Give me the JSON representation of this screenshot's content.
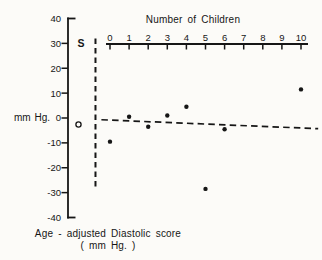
{
  "figure": {
    "bg_color": "#fcfbf8",
    "ink_color": "#161616"
  },
  "chart_data": {
    "type": "scatter",
    "title": "Number of Children",
    "top_axis": {
      "label": "Number of Children",
      "position": "top",
      "ticks": [
        0,
        1,
        2,
        3,
        4,
        5,
        6,
        7,
        8,
        9,
        10
      ],
      "range": [
        0,
        10
      ]
    },
    "y_axis": {
      "label": "mm Hg.",
      "ticks": [
        40,
        30,
        20,
        10,
        0,
        -10,
        -20,
        -30,
        -40
      ],
      "range": [
        -40,
        40
      ]
    },
    "points": [
      {
        "x": 0,
        "y": -9.5
      },
      {
        "x": 1,
        "y": 0.5
      },
      {
        "x": 2,
        "y": -3.5
      },
      {
        "x": 3,
        "y": 1
      },
      {
        "x": 4,
        "y": 4.5
      },
      {
        "x": 5,
        "y": -28.5
      },
      {
        "x": 6,
        "y": -4.5
      },
      {
        "x": 10,
        "y": 11.5
      }
    ],
    "s_label": "S",
    "open_circle_point": {
      "x": -1.65,
      "y": -2.6
    },
    "separator_line": {
      "x": -0.76,
      "y_top": 32,
      "y_bottom": -28,
      "style": "dashed"
    },
    "trend_line": {
      "x1": -0.45,
      "y1": -0.7,
      "x2": 10.9,
      "y2": -4.3,
      "style": "dashed"
    },
    "caption": {
      "line1": "Age - adjusted Diastolic score",
      "line2": "( mm Hg. )"
    },
    "grid": false,
    "legend_position": "none"
  }
}
